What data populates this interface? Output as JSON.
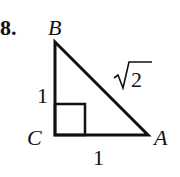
{
  "problem": {
    "number": "8.",
    "vertices": {
      "B": {
        "label": "B",
        "x": 55,
        "y": 42
      },
      "C": {
        "label": "C",
        "x": 55,
        "y": 135
      },
      "A": {
        "label": "A",
        "x": 148,
        "y": 135
      }
    },
    "sides": {
      "BC": "1",
      "CA": "1",
      "AB_radicand": "2",
      "AB_symbol": "√"
    },
    "right_angle_at": "C",
    "colors": {
      "stroke": "#111111",
      "background": "#ffffff"
    }
  }
}
